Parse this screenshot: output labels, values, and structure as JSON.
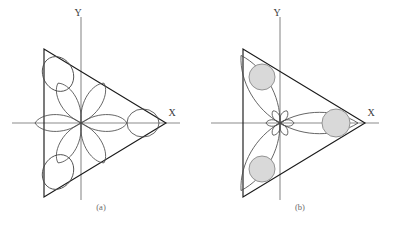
{
  "figure": {
    "width": 398,
    "height": 229,
    "background": "#ffffff"
  },
  "colors": {
    "axis": "#8c8c8c",
    "triangle": "#1a1a1a",
    "lobe": "#4a4a4a",
    "circle_fill": "#d9d9d9",
    "circle_stroke": "#8a8a8a",
    "label": "#3a3a3a",
    "caption": "#6a6a6a"
  },
  "panels": [
    {
      "id": "panel-a",
      "caption": "(a)",
      "caption_pos": {
        "x": 101,
        "y": 210
      },
      "axes": {
        "origin": {
          "x": 81,
          "y": 123
        },
        "x_axis": {
          "x1": 12,
          "y1": 123,
          "x2": 180,
          "y2": 123
        },
        "y_axis": {
          "x1": 81,
          "y1": 17,
          "x2": 81,
          "y2": 200
        },
        "x_label": "X",
        "x_label_pos": {
          "x": 172,
          "y": 116
        },
        "y_label": "Y",
        "y_label_pos": {
          "x": 78,
          "y": 16
        }
      },
      "triangle": {
        "vertices": [
          {
            "x": 44,
            "y": 49
          },
          {
            "x": 44,
            "y": 197
          },
          {
            "x": 166,
            "y": 123
          }
        ]
      },
      "center_lobes": {
        "count": 6,
        "angles_deg": [
          0,
          60,
          120,
          180,
          240,
          300
        ],
        "length": 46,
        "width": 26
      },
      "corner_lobes": {
        "count": 3,
        "shape": "teardrop",
        "items": [
          {
            "cx": 58,
            "cy": 74,
            "rx": 15,
            "ry": 18,
            "rot": -28
          },
          {
            "cx": 58,
            "cy": 172,
            "rx": 15,
            "ry": 18,
            "rot": 28
          },
          {
            "cx": 143,
            "cy": 123,
            "rx": 14,
            "ry": 16,
            "rot": 90
          }
        ]
      }
    },
    {
      "id": "panel-b",
      "caption": "(b)",
      "caption_pos": {
        "x": 300,
        "y": 210
      },
      "axes": {
        "origin": {
          "x": 280,
          "y": 123
        },
        "x_axis": {
          "x1": 211,
          "y1": 123,
          "x2": 379,
          "y2": 123
        },
        "y_axis": {
          "x1": 280,
          "y1": 17,
          "x2": 280,
          "y2": 200
        },
        "x_label": "X",
        "x_label_pos": {
          "x": 371,
          "y": 116
        },
        "y_label": "Y",
        "y_label_pos": {
          "x": 277,
          "y": 16
        }
      },
      "triangle": {
        "vertices": [
          {
            "x": 243,
            "y": 49
          },
          {
            "x": 243,
            "y": 197
          },
          {
            "x": 365,
            "y": 123
          }
        ]
      },
      "center_lobes": {
        "count": 6,
        "angles_deg": [
          0,
          60,
          120,
          180,
          240,
          300
        ],
        "length": 14,
        "width": 10
      },
      "long_lobes": {
        "count": 3,
        "angles_deg": [
          0,
          120,
          240
        ],
        "length": 78,
        "width": 30
      },
      "shaded_circles": [
        {
          "cx": 262,
          "cy": 77,
          "r": 13
        },
        {
          "cx": 262,
          "cy": 169,
          "r": 13
        },
        {
          "cx": 336,
          "cy": 123,
          "r": 14
        }
      ]
    }
  ]
}
